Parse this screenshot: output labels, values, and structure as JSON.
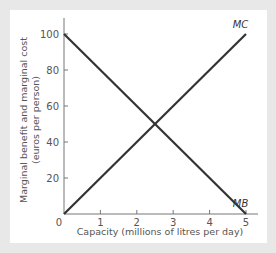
{
  "chart_data": {
    "type": "line",
    "title": "",
    "xlabel": "Capacity (millions of litres per day)",
    "ylabel_line1": "Marginal benefit and marginal cost",
    "ylabel_line2": "(euros per person)",
    "x_ticks": [
      "0",
      "1",
      "2",
      "3",
      "4",
      "5"
    ],
    "y_ticks": [
      "20",
      "40",
      "60",
      "80",
      "100"
    ],
    "xlim": [
      0,
      5
    ],
    "ylim": [
      0,
      100
    ],
    "grid": false,
    "series": [
      {
        "name": "MC",
        "x": [
          0,
          5
        ],
        "y": [
          0,
          100
        ],
        "color": "#333333"
      },
      {
        "name": "MB",
        "x": [
          0,
          5
        ],
        "y": [
          100,
          0
        ],
        "color": "#333333"
      }
    ],
    "annotations": [
      {
        "text": "MC",
        "x": 4.85,
        "y": 102
      },
      {
        "text": "MB",
        "x": 4.85,
        "y": 3
      }
    ],
    "equilibrium": {
      "x": 2.5,
      "y": 50
    }
  },
  "colors": {
    "background": "#e8e8e8",
    "panel": "#ffffff",
    "line": "#333333",
    "axis": "#666666",
    "text": "#555555"
  }
}
